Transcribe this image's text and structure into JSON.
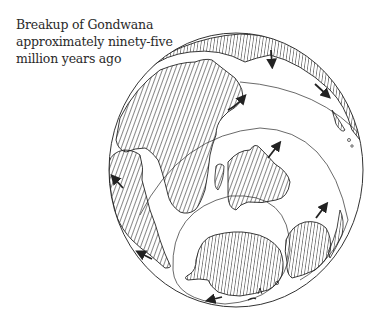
{
  "caption": {
    "line1": "Breakup of Gondwana",
    "line2": "approximately ninety-five",
    "line3": "million years ago"
  },
  "map": {
    "projection": "orthographic globe",
    "ink_color": "#222222",
    "background_color": "#ffffff",
    "landmasses": [
      "africa-arabia",
      "south-america",
      "india-madagascar",
      "antarctica",
      "australia",
      "new-zealand",
      "eurasia-northern-margin"
    ],
    "arrow_count": 8,
    "reference_circles": 3
  }
}
